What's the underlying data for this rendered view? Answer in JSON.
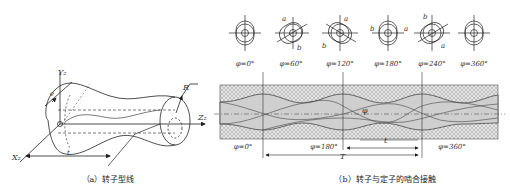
{
  "figure_a": {
    "caption": "（a）转子型线",
    "labels": {
      "y_axis": "Y₂",
      "x_axis": "X₂",
      "z_axis": "Z₂",
      "eccentricity": "e",
      "radius": "R",
      "pitch": "t"
    }
  },
  "figure_b": {
    "caption": "（b）转子与定子的啮合接触",
    "sections": [
      {
        "label": "φ=0°",
        "a": "",
        "b": ""
      },
      {
        "label": "φ=60°",
        "a": "a",
        "b": "b"
      },
      {
        "label": "φ=120°",
        "a": "a",
        "b": "b"
      },
      {
        "label": "φ=180°",
        "a": "a",
        "b": "b"
      },
      {
        "label": "φ=240°",
        "a": "a",
        "b": "b"
      },
      {
        "label": "φ=360°",
        "a": "",
        "b": ""
      }
    ],
    "positions": {
      "p0": "φ=0°",
      "p180": "φ=180°",
      "p360": "φ=360°"
    },
    "angle_label": "φ",
    "rotor_pitch": "t",
    "stator_pitch": "T"
  }
}
